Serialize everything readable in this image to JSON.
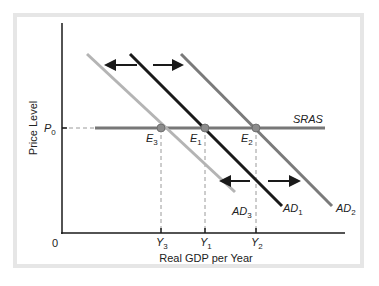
{
  "diagram": {
    "type": "aggregate-demand-shift",
    "axes": {
      "y_label": "Price Level",
      "x_label": "Real GDP per Year",
      "origin_label": "0"
    },
    "price_level": {
      "label_main": "P",
      "label_sub": "0"
    },
    "supply_curve": {
      "label": "SRAS",
      "color": "#777777"
    },
    "demand_curves": [
      {
        "id": "AD3",
        "label_main": "AD",
        "label_sub": "3",
        "color": "#b4b4b4"
      },
      {
        "id": "AD1",
        "label_main": "AD",
        "label_sub": "1",
        "color": "#1a1a1a"
      },
      {
        "id": "AD2",
        "label_main": "AD",
        "label_sub": "2",
        "color": "#7a7a7a"
      }
    ],
    "equilibria": [
      {
        "id": "E3",
        "label_main": "E",
        "label_sub": "3",
        "output_main": "Y",
        "output_sub": "3"
      },
      {
        "id": "E1",
        "label_main": "E",
        "label_sub": "1",
        "output_main": "Y",
        "output_sub": "1"
      },
      {
        "id": "E2",
        "label_main": "E",
        "label_sub": "2",
        "output_main": "Y",
        "output_sub": "2"
      }
    ],
    "arrows": [
      "left",
      "right",
      "left",
      "right"
    ]
  },
  "colors": {
    "frame": "#e6e6e6",
    "axis": "#1a1a1a",
    "dashed": "#9a9a9a",
    "point": "#8c8c8c"
  }
}
